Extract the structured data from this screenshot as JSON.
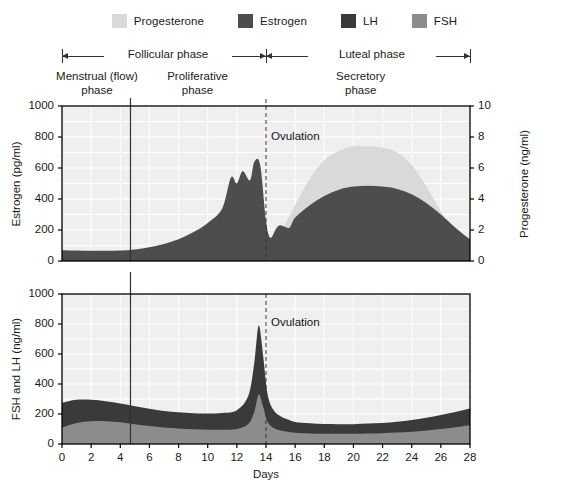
{
  "legend": {
    "items": [
      {
        "label": "Progesterone",
        "color": "#d9d9d9"
      },
      {
        "label": "Estrogen",
        "color": "#4d4d4d"
      },
      {
        "label": "LH",
        "color": "#3a3a3a"
      },
      {
        "label": "FSH",
        "color": "#8c8c8c"
      }
    ]
  },
  "phases": {
    "major": [
      {
        "label": "Follicular phase",
        "start_day": 0,
        "end_day": 14
      },
      {
        "label": "Luteal phase",
        "start_day": 14,
        "end_day": 28
      }
    ],
    "sub": [
      {
        "label_line1": "Menstrual (flow)",
        "label_line2": "phase",
        "center_day": 2.4
      },
      {
        "label_line1": "Proliferative",
        "label_line2": "phase",
        "center_day": 9.3
      },
      {
        "label_line1": "Secretory",
        "label_line2": "phase",
        "center_day": 20.5
      }
    ]
  },
  "markers": {
    "menses_end_line_day": 4.7,
    "ovulation_day": 14,
    "ovulation_label": "Ovulation"
  },
  "chart_data": [
    {
      "type": "area",
      "id": "top-chart",
      "title": "",
      "xlabel": "Days",
      "ylabel": "Estrogen (pg/ml)",
      "ylabel_right": "Progesterone (ng/ml)",
      "xlim": [
        0,
        28
      ],
      "ylim": [
        0,
        1000
      ],
      "ylim_right": [
        0,
        10
      ],
      "xticks": [
        0,
        2,
        4,
        6,
        8,
        10,
        12,
        14,
        16,
        18,
        20,
        22,
        24,
        26,
        28
      ],
      "yticks": [
        0,
        200,
        400,
        600,
        800,
        1000
      ],
      "yticks_right": [
        0,
        2,
        4,
        6,
        8,
        10
      ],
      "grid": true,
      "legend_position": "top",
      "annotations": [
        {
          "text": "Ovulation",
          "day": 14
        }
      ],
      "series": [
        {
          "name": "Progesterone",
          "axis": "right",
          "color": "#d9d9d9",
          "units": "ng/ml",
          "x": [
            0,
            1,
            2,
            3,
            4,
            5,
            6,
            7,
            8,
            9,
            10,
            11,
            12,
            13,
            13.6,
            14,
            14.4,
            15,
            16,
            17,
            18,
            19,
            20,
            21,
            22,
            23,
            24,
            25,
            26,
            27,
            28
          ],
          "values": [
            0.4,
            0.4,
            0.4,
            0.4,
            0.4,
            0.4,
            0.4,
            0.4,
            0.4,
            0.4,
            0.4,
            0.4,
            0.45,
            0.5,
            0.6,
            0.7,
            1.0,
            1.8,
            3.6,
            5.3,
            6.5,
            7.1,
            7.4,
            7.4,
            7.3,
            7.0,
            6.2,
            4.8,
            3.2,
            1.8,
            0.9
          ]
        },
        {
          "name": "Estrogen",
          "axis": "left",
          "color": "#4d4d4d",
          "units": "pg/ml",
          "x": [
            0,
            1,
            2,
            3,
            4,
            5,
            6,
            7,
            8,
            9,
            10,
            11,
            11.6,
            12,
            12.4,
            12.9,
            13.2,
            13.6,
            14,
            14.3,
            14.7,
            15,
            15.6,
            16,
            17,
            18,
            19,
            20,
            21,
            22,
            23,
            24,
            25,
            26,
            27,
            28
          ],
          "values": [
            70,
            68,
            66,
            66,
            68,
            75,
            88,
            110,
            140,
            185,
            245,
            340,
            540,
            500,
            580,
            520,
            640,
            620,
            260,
            150,
            210,
            230,
            215,
            280,
            360,
            420,
            460,
            480,
            485,
            480,
            465,
            430,
            375,
            300,
            215,
            140
          ]
        }
      ]
    },
    {
      "type": "area",
      "id": "bottom-chart",
      "title": "",
      "xlabel": "Days",
      "ylabel": "FSH and LH (ng/ml)",
      "xlim": [
        0,
        28
      ],
      "ylim": [
        0,
        1000
      ],
      "xticks": [
        0,
        2,
        4,
        6,
        8,
        10,
        12,
        14,
        16,
        18,
        20,
        22,
        24,
        26,
        28
      ],
      "yticks": [
        0,
        200,
        400,
        600,
        800,
        1000
      ],
      "grid": true,
      "stacked": true,
      "annotations": [
        {
          "text": "Ovulation",
          "day": 14
        }
      ],
      "series": [
        {
          "name": "FSH",
          "color": "#8c8c8c",
          "units": "ng/ml",
          "x": [
            0,
            1,
            2,
            3,
            4,
            5,
            6,
            7,
            8,
            9,
            10,
            11,
            12,
            12.8,
            13.2,
            13.5,
            13.8,
            14.1,
            14.5,
            15,
            15.6,
            16,
            17,
            18,
            19,
            20,
            21,
            22,
            23,
            24,
            25,
            26,
            27,
            28
          ],
          "values": [
            110,
            140,
            152,
            152,
            145,
            132,
            120,
            110,
            103,
            98,
            95,
            95,
            100,
            135,
            215,
            330,
            250,
            150,
            108,
            90,
            80,
            75,
            70,
            68,
            68,
            68,
            70,
            72,
            76,
            82,
            90,
            100,
            112,
            125
          ]
        },
        {
          "name": "LH",
          "color": "#3a3a3a",
          "units": "ng/ml",
          "x": [
            0,
            1,
            2,
            3,
            4,
            5,
            6,
            7,
            8,
            9,
            10,
            11,
            12,
            12.8,
            13.2,
            13.5,
            13.8,
            14.1,
            14.5,
            15,
            15.6,
            16,
            17,
            18,
            19,
            20,
            21,
            22,
            23,
            24,
            25,
            26,
            27,
            28
          ],
          "values": [
            165,
            155,
            143,
            133,
            125,
            120,
            115,
            110,
            108,
            107,
            108,
            112,
            125,
            190,
            330,
            460,
            340,
            185,
            120,
            95,
            80,
            72,
            68,
            65,
            64,
            64,
            66,
            68,
            72,
            78,
            85,
            93,
            102,
            112
          ]
        }
      ]
    }
  ]
}
